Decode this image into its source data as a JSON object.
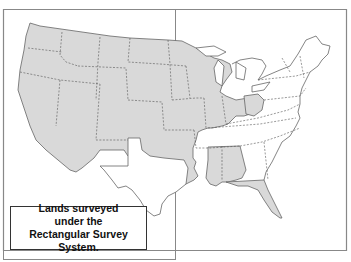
{
  "map": {
    "title": "Lands surveyed under the Rectangular Survey System",
    "colors": {
      "surveyed_fill": "#d9d9d9",
      "unsurveyed_fill": "#ffffff",
      "border": "#777777",
      "state_line": "#555555"
    },
    "legend": {
      "line1": "Lands surveyed",
      "line2": "under the",
      "line3": "Rectangular Survey System."
    }
  }
}
